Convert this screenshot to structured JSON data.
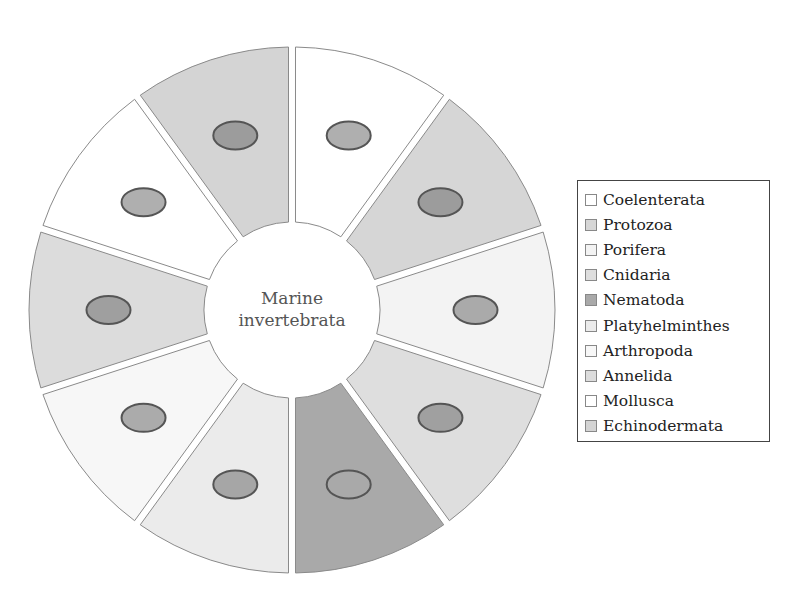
{
  "diagram": {
    "title": "Marine invertebrata",
    "center_label_lines": [
      "Marine",
      "invertebrata"
    ],
    "center": [
      292,
      310
    ],
    "outer_radius": 263,
    "inner_radius": 88,
    "segments": [
      {
        "label": "Coelenterata",
        "color": "#ffffff",
        "organism": "jellyfish-icon"
      },
      {
        "label": "Protozoa",
        "color": "#d6d6d6",
        "organism": "protozoan-icon"
      },
      {
        "label": "Porifera",
        "color": "#f3f3f3",
        "organism": "sponge-coral-icon"
      },
      {
        "label": "Cnidaria",
        "color": "#dedede",
        "organism": "anemone-icon"
      },
      {
        "label": "Nematoda",
        "color": "#a9a9a9",
        "organism": "roundworm-icon"
      },
      {
        "label": "Platyhelminthes",
        "color": "#ebebeb",
        "organism": "flatworm-icon"
      },
      {
        "label": "Arthropoda",
        "color": "#f7f7f7",
        "organism": "shrimp-icon"
      },
      {
        "label": "Annelida",
        "color": "#dcdcdc",
        "organism": "segmented-worm-icon"
      },
      {
        "label": "Mollusca",
        "color": "#ffffff",
        "organism": "snail-icon"
      },
      {
        "label": "Echinodermata",
        "color": "#d4d4d4",
        "organism": "starfish-icon"
      }
    ]
  },
  "legend": {
    "items": [
      {
        "label": "Coelenterata",
        "color": "#ffffff"
      },
      {
        "label": "Protozoa",
        "color": "#d6d6d6"
      },
      {
        "label": "Porifera",
        "color": "#f3f3f3"
      },
      {
        "label": "Cnidaria",
        "color": "#dedede"
      },
      {
        "label": "Nematoda",
        "color": "#a9a9a9"
      },
      {
        "label": "Platyhelminthes",
        "color": "#ebebeb"
      },
      {
        "label": "Arthropoda",
        "color": "#f7f7f7"
      },
      {
        "label": "Annelida",
        "color": "#dcdcdc"
      },
      {
        "label": "Mollusca",
        "color": "#ffffff"
      },
      {
        "label": "Echinodermata",
        "color": "#d4d4d4"
      }
    ]
  }
}
